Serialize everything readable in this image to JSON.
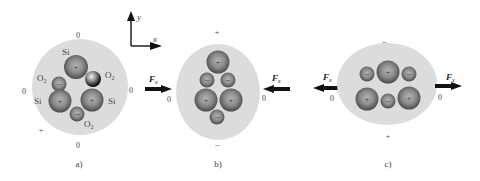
{
  "figure": {
    "axes": {
      "x_label": "x",
      "y_label": "y"
    },
    "panels": [
      {
        "id": "a",
        "caption": "a)",
        "description": "SiO2 unit in equilibrium, no force applied",
        "charge_labels": {
          "top": "0",
          "left": "0",
          "right": "0",
          "bottom": "0",
          "corner": "+"
        },
        "atoms": [
          {
            "label": "Si",
            "charge": "+"
          },
          {
            "label": "O2",
            "charge": "−"
          },
          {
            "label": "O2",
            "charge": ""
          },
          {
            "label": "Si",
            "charge": "+"
          },
          {
            "label": "Si",
            "charge": "+"
          },
          {
            "label": "O2",
            "charge": "−"
          }
        ]
      },
      {
        "id": "b",
        "caption": "b)",
        "description": "Compressed along x",
        "charge_labels": {
          "top": "+",
          "bottom": "−",
          "left": "0",
          "right": "0"
        },
        "force_left": {
          "label": "Fx",
          "subscript": "x",
          "main": "F",
          "direction": "right",
          "zero": "0",
          "outer_zero": "0"
        },
        "force_right": {
          "label": "Fx",
          "main": "F",
          "subscript": "x",
          "direction": "left",
          "zero": "0"
        }
      },
      {
        "id": "c",
        "caption": "c)",
        "description": "Stretched along x",
        "charge_labels": {
          "top": "−",
          "bottom": "+",
          "left": "0",
          "right": "0"
        },
        "force_left": {
          "label": "Fx",
          "main": "F",
          "subscript": "x",
          "direction": "left",
          "zero": "0"
        },
        "force_right": {
          "label": "Fx",
          "main": "F",
          "subscript": "x",
          "direction": "right",
          "zero": "0"
        }
      }
    ],
    "colors": {
      "shell": "#dcdcdc",
      "atom_dark": "#555555",
      "atom_light": "#b8b8b8",
      "arrow": "#111111"
    }
  }
}
